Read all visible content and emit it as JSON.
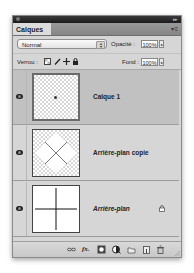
{
  "panel": {
    "tab_label": "Calques",
    "menu_icon": "panel-menu-icon",
    "collapse_icon": "collapse-icon"
  },
  "options": {
    "blend_mode": "Normal",
    "opacity_label": "Opacité :",
    "opacity_value": "100%",
    "lock_label": "Verrou :",
    "fill_label": "Fond :",
    "fill_value": "100%",
    "lock_icons": [
      "lock-transparent-pixels-icon",
      "lock-image-pixels-icon",
      "lock-position-icon",
      "lock-all-icon"
    ]
  },
  "layers": [
    {
      "name": "Calque 1",
      "selected": true,
      "visible": true,
      "thumbnail": "dot-on-transparent",
      "locked": false,
      "italic": false
    },
    {
      "name": "Arrière-plan copie",
      "selected": false,
      "visible": true,
      "thumbnail": "x-on-transparent",
      "locked": false,
      "italic": false
    },
    {
      "name": "Arrière-plan",
      "selected": false,
      "visible": true,
      "thumbnail": "cross-on-white",
      "locked": true,
      "italic": true
    }
  ],
  "footer": {
    "icons": [
      "link-layers-icon",
      "layer-style-fx-icon",
      "add-mask-icon",
      "adjustment-layer-icon",
      "new-group-icon",
      "new-layer-icon",
      "delete-layer-icon"
    ],
    "fx_label": "fx."
  },
  "colors": {
    "panel_bg": "#d6d6d6",
    "selected_row": "#c1c1c1",
    "titlebar": "#2a2a2a",
    "tabbar": "#8f8f8f"
  }
}
